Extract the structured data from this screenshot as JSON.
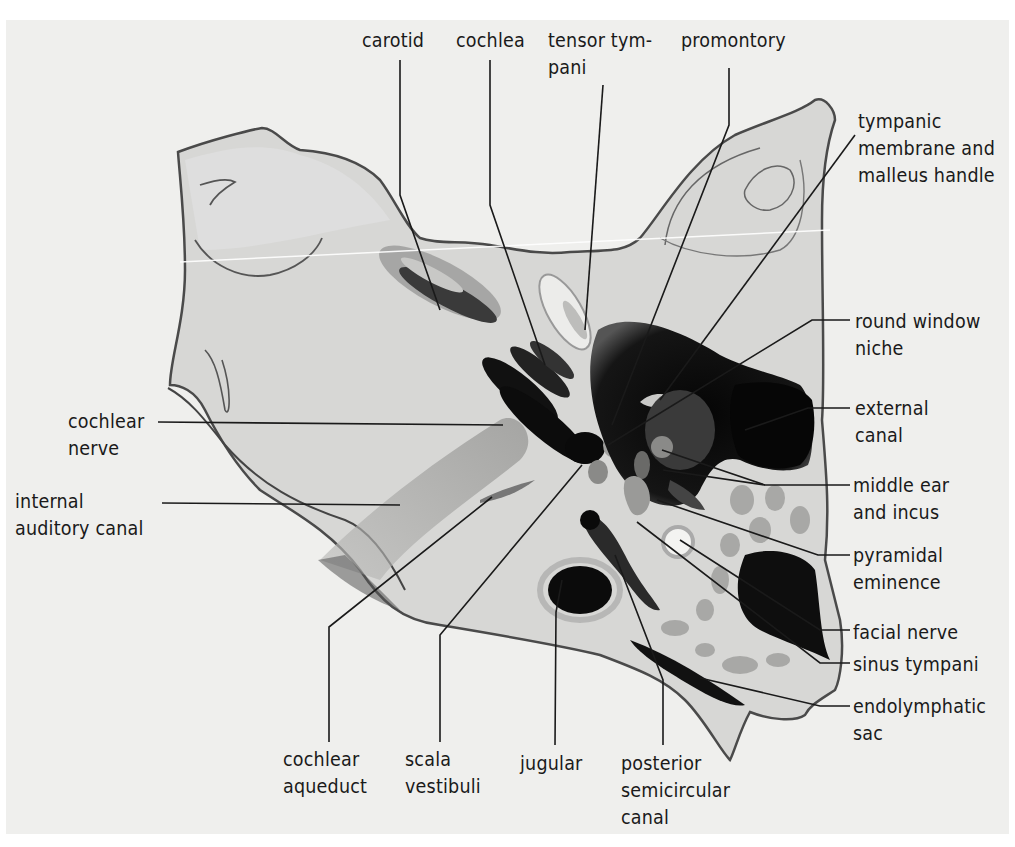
{
  "figure": {
    "colors": {
      "paper": "#efefed",
      "bone": "#d7d7d5",
      "outline": "#444444",
      "dark": "#0d0d0d",
      "leader": "#1a1a1a"
    }
  },
  "labels": [
    {
      "id": "carotid",
      "lines": [
        "carotid"
      ],
      "x": 362,
      "y": 27,
      "leader": [
        [
          400,
          60
        ],
        [
          400,
          195
        ],
        [
          440,
          310
        ]
      ]
    },
    {
      "id": "cochlea",
      "lines": [
        "cochlea"
      ],
      "x": 456,
      "y": 27,
      "leader": [
        [
          490,
          60
        ],
        [
          490,
          205
        ],
        [
          545,
          365
        ]
      ]
    },
    {
      "id": "tensor-tympani",
      "lines": [
        "tensor tym-",
        "pani"
      ],
      "x": 548,
      "y": 27,
      "leader": [
        [
          603,
          85
        ],
        [
          585,
          330
        ]
      ]
    },
    {
      "id": "promontory",
      "lines": [
        "promontory"
      ],
      "x": 681,
      "y": 27,
      "leader": [
        [
          729,
          68
        ],
        [
          729,
          125
        ],
        [
          612,
          425
        ]
      ]
    },
    {
      "id": "tympanic-membrane",
      "lines": [
        "tympanic",
        "membrane and",
        "malleus handle"
      ],
      "x": 858,
      "y": 108,
      "leader": [
        [
          855,
          135
        ],
        [
          660,
          400
        ]
      ]
    },
    {
      "id": "round-window",
      "lines": [
        "round window",
        "niche"
      ],
      "x": 855,
      "y": 308,
      "leader": [
        [
          850,
          320
        ],
        [
          812,
          320
        ],
        [
          608,
          445
        ]
      ]
    },
    {
      "id": "external-canal",
      "lines": [
        "external",
        "canal"
      ],
      "x": 855,
      "y": 395,
      "leader": [
        [
          850,
          408
        ],
        [
          808,
          408
        ],
        [
          745,
          430
        ]
      ]
    },
    {
      "id": "middle-ear-incus",
      "lines": [
        "middle ear",
        "and incus"
      ],
      "x": 853,
      "y": 472,
      "leader": [
        [
          850,
          485
        ],
        [
          765,
          485
        ],
        [
          662,
          450
        ]
      ],
      "leader2": [
        [
          765,
          485
        ],
        [
          663,
          470
        ]
      ]
    },
    {
      "id": "pyramidal",
      "lines": [
        "pyramidal",
        "eminence"
      ],
      "x": 853,
      "y": 542,
      "leader": [
        [
          850,
          555
        ],
        [
          818,
          555
        ],
        [
          657,
          500
        ]
      ]
    },
    {
      "id": "facial-nerve",
      "lines": [
        "facial nerve"
      ],
      "x": 853,
      "y": 619,
      "leader": [
        [
          850,
          630
        ],
        [
          820,
          630
        ],
        [
          680,
          540
        ]
      ]
    },
    {
      "id": "sinus-tympani",
      "lines": [
        "sinus tympani"
      ],
      "x": 853,
      "y": 651,
      "leader": [
        [
          850,
          663
        ],
        [
          820,
          663
        ],
        [
          637,
          522
        ]
      ]
    },
    {
      "id": "endolymphatic",
      "lines": [
        "endolymphatic",
        "sac"
      ],
      "x": 853,
      "y": 693,
      "leader": [
        [
          850,
          706
        ],
        [
          820,
          706
        ],
        [
          700,
          678
        ]
      ]
    },
    {
      "id": "cochlear-nerve",
      "lines": [
        "cochlear",
        "nerve"
      ],
      "x": 68,
      "y": 408,
      "leader": [
        [
          158,
          422
        ],
        [
          503,
          425
        ]
      ]
    },
    {
      "id": "internal-canal",
      "lines": [
        "internal",
        "auditory canal"
      ],
      "x": 15,
      "y": 488,
      "leader": [
        [
          162,
          503
        ],
        [
          400,
          505
        ]
      ]
    },
    {
      "id": "cochlear-aqueduct",
      "lines": [
        "cochlear",
        "aqueduct"
      ],
      "x": 283,
      "y": 746,
      "leader": [
        [
          329,
          742
        ],
        [
          329,
          627
        ],
        [
          492,
          497
        ]
      ]
    },
    {
      "id": "scala-vestibuli",
      "lines": [
        "scala",
        "vestibuli"
      ],
      "x": 405,
      "y": 746,
      "leader": [
        [
          440,
          742
        ],
        [
          440,
          635
        ],
        [
          582,
          465
        ]
      ]
    },
    {
      "id": "jugular",
      "lines": [
        "jugular"
      ],
      "x": 520,
      "y": 750,
      "leader": [
        [
          555,
          745
        ],
        [
          556,
          612
        ],
        [
          562,
          580
        ]
      ]
    },
    {
      "id": "posterior-canal",
      "lines": [
        "posterior",
        "semicircular",
        "canal"
      ],
      "x": 621,
      "y": 750,
      "leader": [
        [
          663,
          745
        ],
        [
          663,
          680
        ],
        [
          615,
          555
        ]
      ]
    }
  ]
}
